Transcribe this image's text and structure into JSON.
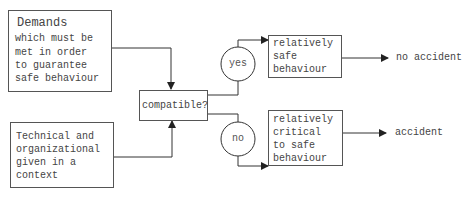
{
  "diagram": {
    "demands_box": {
      "title": "Demands",
      "lines": [
        "which must be",
        "met in order",
        "to guarantee",
        "safe behaviour"
      ]
    },
    "context_box": {
      "lines": [
        "Technical and",
        "organizational",
        "given in a",
        "context"
      ]
    },
    "decision_box": {
      "label": "compatible?"
    },
    "yes_node": {
      "label": "yes"
    },
    "no_node": {
      "label": "no"
    },
    "safe_box": {
      "lines": [
        "relatively",
        "safe",
        "behaviour"
      ]
    },
    "critical_box": {
      "lines": [
        "relatively",
        "critical",
        "to safe",
        "behaviour"
      ]
    },
    "outcomes": {
      "no_accident": "no accident",
      "accident": "accident"
    },
    "colors": {
      "line": "#333333",
      "text": "#444444",
      "background": "#ffffff"
    }
  }
}
